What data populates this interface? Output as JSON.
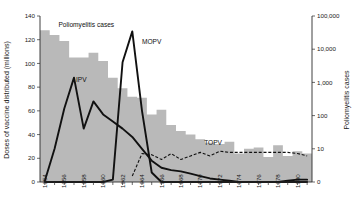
{
  "chart_data": {
    "type": "bar",
    "title": "",
    "subtitle": "",
    "xlabel": "",
    "ylabel": "Doses of vaccine distributed (millions)",
    "y2label": "Poliomyelitis cases",
    "grid": false,
    "legend_position": "inline-annotations",
    "x_axis": {
      "label": "",
      "ticks": [
        1954,
        1956,
        1958,
        1960,
        1962,
        1964,
        1966,
        1968,
        1970,
        1972,
        1974,
        1976,
        1978,
        1980
      ],
      "tick_labels": [
        "1954",
        "1956",
        "1958",
        "1960",
        "1962",
        "1964",
        "1966",
        "1968",
        "1970",
        "1972",
        "1974",
        "1976",
        "1978",
        "1980"
      ],
      "range": [
        1953.5,
        1981.5
      ]
    },
    "y_axis_left": {
      "label": "Doses of vaccine distributed (millions)",
      "ticks": [
        0,
        20,
        40,
        60,
        80,
        100,
        120,
        140
      ],
      "tick_labels": [
        "0",
        "20",
        "40",
        "60",
        "80",
        "100",
        "120",
        "140"
      ],
      "ylim": [
        0,
        140
      ],
      "scale": "linear"
    },
    "y_axis_right": {
      "label": "Poliomyelitis cases",
      "ticks": [
        0,
        10,
        100,
        1000,
        10000,
        100000
      ],
      "tick_labels": [
        "0",
        "10",
        "100",
        "1,000",
        "10,000",
        "100,000"
      ],
      "scale": "log-with-zero"
    },
    "categories": [
      1954,
      1955,
      1956,
      1957,
      1958,
      1959,
      1960,
      1961,
      1962,
      1963,
      1964,
      1965,
      1966,
      1967,
      1968,
      1969,
      1970,
      1971,
      1972,
      1973,
      1974,
      1975,
      1976,
      1977,
      1978,
      1979,
      1980,
      1981
    ],
    "series": [
      {
        "name": "Poliomyelitis cases",
        "label": "Poliomyelitis cases",
        "type": "bar",
        "axis": "right",
        "color": "#b9b9b9",
        "values_left_scale": [
          128,
          124,
          119,
          105,
          105,
          109,
          102,
          88,
          79,
          72,
          71,
          57,
          61,
          48,
          43,
          40,
          36,
          33,
          32,
          34,
          24,
          28,
          29,
          21,
          31,
          22,
          26,
          24
        ]
      },
      {
        "name": "IPV",
        "label": "IPV",
        "type": "line",
        "style": "solid",
        "axis": "left",
        "color": "#111111",
        "values": [
          1,
          28,
          62,
          88,
          45,
          68,
          57,
          51,
          45,
          38,
          28,
          18,
          12,
          10,
          9,
          7,
          5,
          3,
          2,
          1,
          0,
          0,
          0,
          0,
          0,
          1,
          2,
          2
        ]
      },
      {
        "name": "MOPV",
        "label": "MOPV",
        "type": "line",
        "style": "solid",
        "axis": "left",
        "color": "#111111",
        "values": [
          0,
          0,
          0,
          0,
          0,
          0,
          0,
          2,
          101,
          127,
          60,
          8,
          0,
          0,
          0,
          0,
          0,
          0,
          0,
          0,
          0,
          0,
          0,
          0,
          0,
          0,
          0,
          0
        ]
      },
      {
        "name": "TOPV",
        "label": "TOPV",
        "type": "line",
        "style": "dashed",
        "axis": "left",
        "color": "#111111",
        "values": [
          null,
          null,
          null,
          null,
          null,
          null,
          null,
          null,
          null,
          5,
          24,
          23,
          19,
          24,
          19,
          22,
          25,
          22,
          26,
          25,
          25,
          25,
          25,
          25,
          25,
          25,
          24,
          22
        ]
      }
    ],
    "annotations": [
      {
        "text": "Poliomyelitis cases",
        "x": 1955.4,
        "y": 131
      },
      {
        "text": "IPV",
        "x": 1957.2,
        "y": 84
      },
      {
        "text": "MOPV",
        "x": 1964.0,
        "y": 116
      },
      {
        "text": "TOPV",
        "x": 1970.4,
        "y": 31
      }
    ],
    "colors": {
      "bars": "#b9b9b9",
      "lines": "#111111",
      "axis": "#2b2b2b",
      "background": "#ffffff"
    }
  }
}
